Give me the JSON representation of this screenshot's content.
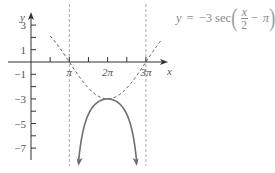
{
  "chart_data": {
    "type": "line",
    "xlabel": "x",
    "ylabel": "y",
    "equation": {
      "lhs": "y",
      "equals": "=",
      "coefficient": "−3 sec",
      "frac_num": "x",
      "frac_den": "2",
      "minus": "−",
      "pi": "π"
    },
    "x_ticks": [
      {
        "value_pi": 0.5,
        "label": ""
      },
      {
        "value_pi": 1,
        "label": "π"
      },
      {
        "value_pi": 1.5,
        "label": ""
      },
      {
        "value_pi": 2,
        "label": "2π"
      },
      {
        "value_pi": 2.5,
        "label": ""
      },
      {
        "value_pi": 3,
        "label": "3π"
      }
    ],
    "y_ticks": [
      {
        "value": 3,
        "label": "3"
      },
      {
        "value": 2,
        "label": ""
      },
      {
        "value": 1,
        "label": "1"
      },
      {
        "value": -1,
        "label": "−1"
      },
      {
        "value": -2,
        "label": ""
      },
      {
        "value": -3,
        "label": "−3"
      },
      {
        "value": -4,
        "label": ""
      },
      {
        "value": -5,
        "label": "−5"
      },
      {
        "value": -6,
        "label": ""
      },
      {
        "value": -7,
        "label": "−7"
      }
    ],
    "xlim_pi": [
      0,
      3.4
    ],
    "ylim": [
      -8.2,
      3.9
    ],
    "asymptotes_x_pi": [
      1,
      3
    ],
    "series": [
      {
        "name": "y = −3 sec(x/2 − π)",
        "style": "solid",
        "function": "3/cos(x/2)",
        "domain_pi": [
          1.238,
          2.762
        ],
        "key_points": [
          {
            "x": "2π",
            "y": -3
          }
        ],
        "end_arrows": true
      },
      {
        "name": "y = −3 cos(x/2 − π)",
        "style": "dashed",
        "function": "3*cos(x/2)",
        "domain_pi": [
          0.5,
          3.5
        ],
        "key_points": [
          {
            "x": "π",
            "y": 0
          },
          {
            "x": "2π",
            "y": -3
          },
          {
            "x": "3π",
            "y": 0
          }
        ]
      }
    ],
    "grid": false,
    "legend": "none",
    "colors": {
      "axis": "#333333",
      "solid_curve": "#6e6e6e",
      "dashed_curve": "#555555",
      "asymptote": "#a8a8a8",
      "equation_text": "#8a8a8a"
    }
  }
}
